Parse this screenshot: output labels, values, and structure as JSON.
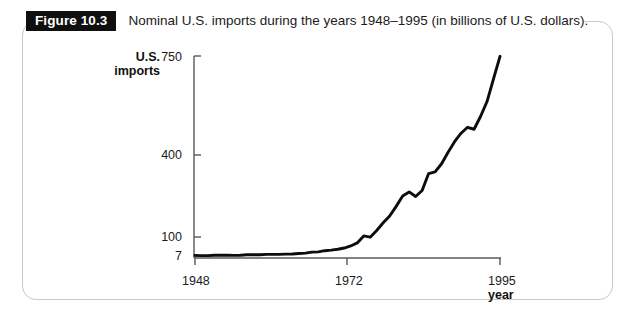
{
  "figure": {
    "tag": "Figure 10.3",
    "caption": "Nominal U.S. imports during the years 1948–1995 (in billions of U.S. dollars)."
  },
  "chart_data": {
    "type": "line",
    "title": "Nominal U.S. imports during the years 1948–1995 (in billions of U.S. dollars).",
    "xlabel": "year",
    "ylabel": "U.S. imports",
    "x_tick_labels": [
      "1948",
      "1972",
      "1995"
    ],
    "x_ticks": [
      1948,
      1972,
      1995
    ],
    "y_tick_labels": [
      "7",
      "100",
      "400",
      "750"
    ],
    "y_ticks": [
      7,
      100,
      400,
      750
    ],
    "xlim": [
      1948,
      1995
    ],
    "ylim": [
      7,
      750
    ],
    "y_scale": "compressed-nonlinear",
    "grid": false,
    "legend": false,
    "series": [
      {
        "name": "U.S. imports",
        "color": "#0d0d0d",
        "x": [
          1948,
          1949,
          1950,
          1951,
          1952,
          1953,
          1954,
          1955,
          1956,
          1957,
          1958,
          1959,
          1960,
          1961,
          1962,
          1963,
          1964,
          1965,
          1966,
          1967,
          1968,
          1969,
          1970,
          1971,
          1972,
          1973,
          1974,
          1975,
          1976,
          1977,
          1978,
          1979,
          1980,
          1981,
          1982,
          1983,
          1984,
          1985,
          1986,
          1987,
          1988,
          1989,
          1990,
          1991,
          1992,
          1993,
          1994,
          1995
        ],
        "values": [
          10,
          9,
          9,
          11,
          11,
          11,
          10,
          11,
          13,
          13,
          13,
          15,
          15,
          15,
          16,
          17,
          19,
          21,
          26,
          27,
          33,
          36,
          40,
          46,
          56,
          71,
          104,
          99,
          124,
          152,
          177,
          212,
          250,
          265,
          248,
          270,
          332,
          338,
          368,
          410,
          447,
          477,
          498,
          491,
          536,
          589,
          669,
          749
        ]
      }
    ],
    "annotations": []
  }
}
